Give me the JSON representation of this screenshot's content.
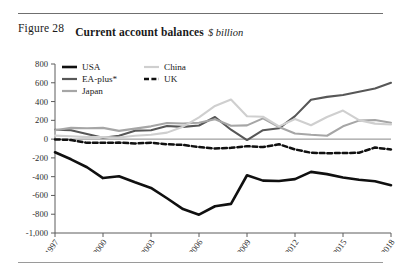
{
  "figure": {
    "number": "Figure 28",
    "title": "Current account balances",
    "subtitle": "$ billion"
  },
  "legend": {
    "position": "top-left-inside",
    "entries": [
      {
        "label": "USA",
        "color": "#101010",
        "style": "solid",
        "width": 2.6
      },
      {
        "label": "EA-plus*",
        "color": "#575757",
        "style": "solid",
        "width": 2.2
      },
      {
        "label": "Japan",
        "color": "#a6a6a6",
        "style": "solid",
        "width": 2.2
      },
      {
        "label": "China",
        "color": "#cfcfcf",
        "style": "solid",
        "width": 2.2
      },
      {
        "label": "UK",
        "color": "#101010",
        "style": "dashed",
        "width": 2.4
      }
    ]
  },
  "axes": {
    "y_ticks": [
      "800",
      "600",
      "400",
      "200",
      "0",
      "-200",
      "-400",
      "-600",
      "-800",
      "-1,000"
    ],
    "x_ticks": [
      "1997",
      "2000",
      "2003",
      "2006",
      "2009",
      "2012",
      "2015",
      "2018"
    ]
  },
  "chart_data": {
    "type": "line",
    "title": "Current account balances",
    "subtitle": "$ billion",
    "xlabel": "",
    "ylabel": "$ billion",
    "ylim": [
      -1000,
      800
    ],
    "ytick_step": 200,
    "grid": false,
    "zero_line": true,
    "legend_position": "upper left",
    "x": [
      1997,
      1998,
      1999,
      2000,
      2001,
      2002,
      2003,
      2004,
      2005,
      2006,
      2007,
      2008,
      2009,
      2010,
      2011,
      2012,
      2013,
      2014,
      2015,
      2016,
      2017,
      2018
    ],
    "series": [
      {
        "name": "USA",
        "color": "#101010",
        "style": "solid",
        "values": [
          -140,
          -215,
          -300,
          -415,
          -395,
          -460,
          -520,
          -630,
          -745,
          -805,
          -715,
          -690,
          -385,
          -442,
          -446,
          -426,
          -349,
          -373,
          -408,
          -433,
          -449,
          -491
        ]
      },
      {
        "name": "EA-plus*",
        "color": "#575757",
        "style": "solid",
        "values": [
          100,
          95,
          55,
          15,
          35,
          90,
          95,
          140,
          130,
          145,
          235,
          100,
          -10,
          95,
          115,
          245,
          420,
          450,
          470,
          505,
          540,
          600
        ]
      },
      {
        "name": "Japan",
        "color": "#a6a6a6",
        "style": "solid",
        "values": [
          95,
          120,
          115,
          120,
          88,
          112,
          136,
          172,
          166,
          174,
          212,
          142,
          146,
          221,
          129,
          60,
          46,
          36,
          136,
          197,
          203,
          175
        ]
      },
      {
        "name": "China",
        "color": "#cfcfcf",
        "style": "solid",
        "values": [
          37,
          31,
          21,
          21,
          17,
          35,
          46,
          69,
          132,
          232,
          353,
          421,
          243,
          238,
          136,
          215,
          148,
          236,
          304,
          202,
          165,
          155
        ]
      },
      {
        "name": "UK",
        "color": "#101010",
        "style": "dashed",
        "values": [
          -3,
          -9,
          -40,
          -40,
          -37,
          -46,
          -38,
          -55,
          -62,
          -85,
          -100,
          -93,
          -75,
          -85,
          -55,
          -110,
          -145,
          -150,
          -148,
          -145,
          -90,
          -110
        ]
      }
    ]
  }
}
